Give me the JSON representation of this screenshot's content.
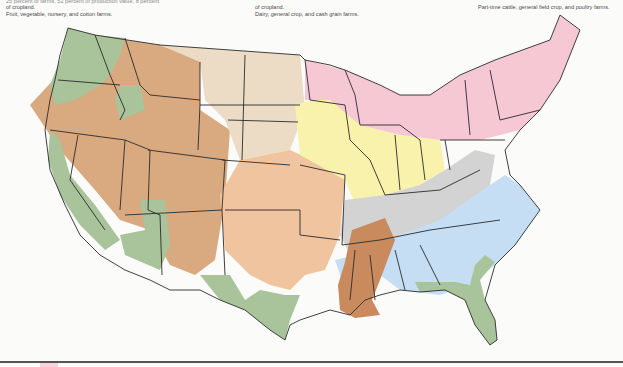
{
  "captions": {
    "left": {
      "line_cut": "25 percent of farms, 52 percent of production value, 8 percent",
      "line2": "of cropland.",
      "line3": "Fruit, vegetable, nursery, and cotton farms."
    },
    "middle": {
      "line2": "of cropland.",
      "line3": "Dairy, general crop, and cash grain farms."
    },
    "right": {
      "line3": "Part-time cattle, general field crop, and poultry farms."
    }
  },
  "map": {
    "title": "Farm resource regions of the contiguous United States",
    "colors": {
      "fruitful_rim_green": "#a9c39a",
      "basin_range_brown": "#d9a97f",
      "northern_great_plains_tan": "#ecdcc6",
      "prairie_gateway_peach": "#f1c4a0",
      "heartland_yellow": "#f8f2ad",
      "northern_crescent_pink": "#f5c8d4",
      "eastern_uplands_gray": "#d3d3d3",
      "southern_seaboard_blue": "#c6def3",
      "mississippi_portal_rust": "#c98a5e",
      "state_border": "#2b2b2b",
      "background": "#fbfbfa"
    }
  }
}
